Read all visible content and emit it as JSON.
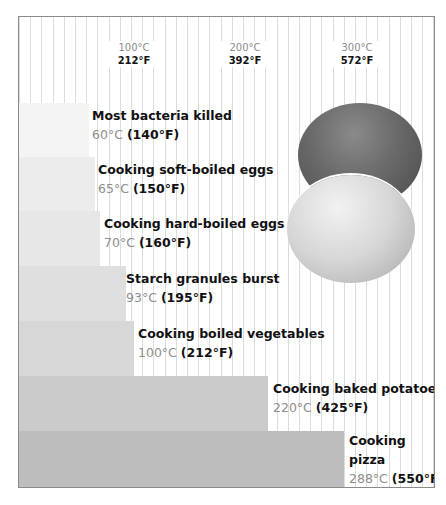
{
  "chart_data": {
    "type": "bar",
    "orientation": "horizontal",
    "title": "",
    "xlabel": "Temperature",
    "ylabel": "",
    "x_scale": {
      "min_c": 0,
      "px_per_c": 1.117,
      "origin_px": 3
    },
    "xlim_c": [
      0,
      370
    ],
    "grid": {
      "vertical": true,
      "spacing_px": 11.2
    },
    "ticks": [
      {
        "c": "100°C",
        "f": "212°F",
        "value": 100
      },
      {
        "c": "200°C",
        "f": "392°F",
        "value": 200
      },
      {
        "c": "300°C",
        "f": "572°F",
        "value": 300
      }
    ],
    "categories": [
      "Most bacteria killed",
      "Cooking soft-boiled eggs",
      "Cooking hard-boiled eggs",
      "Starch granules burst",
      "Cooking boiled vegetables",
      "Cooking baked potatoes",
      "Cooking pizza"
    ],
    "values_c": [
      60,
      65,
      70,
      93,
      100,
      220,
      288
    ],
    "values_f": [
      140,
      150,
      160,
      195,
      212,
      425,
      550
    ],
    "bars": [
      {
        "title": "Most bacteria killed",
        "c_label": "60°C",
        "f_label": "(140°F)",
        "value": 60,
        "top": 86,
        "height": 54,
        "color": "#f4f4f4",
        "label_left": 73,
        "label_top": 0
      },
      {
        "title": "Cooking soft-boiled eggs",
        "c_label": "65°C",
        "f_label": "(150°F)",
        "value": 65,
        "top": 140,
        "height": 54,
        "color": "#ececec",
        "label_left": 79,
        "label_top": 0
      },
      {
        "title": "Cooking hard-boiled eggs",
        "c_label": "70°C",
        "f_label": "(160°F)",
        "value": 70,
        "top": 194,
        "height": 55,
        "color": "#e7e7e7",
        "label_left": 85,
        "label_top": 0
      },
      {
        "title": "Starch granules burst",
        "c_label": "93°C",
        "f_label": "(195°F)",
        "value": 93,
        "top": 249,
        "height": 55,
        "color": "#dfdfdf",
        "label_left": 107,
        "label_top": 0
      },
      {
        "title": "Cooking boiled vegetables",
        "c_label": "100°C",
        "f_label": "(212°F)",
        "value": 100,
        "top": 304,
        "height": 55,
        "color": "#d7d7d7",
        "label_left": 119,
        "label_top": 0
      },
      {
        "title": "Cooking baked potatoes",
        "c_label": "220°C",
        "f_label": "(425°F)",
        "value": 220,
        "top": 359,
        "height": 55,
        "color": "#cbcbcb",
        "label_left": 254,
        "label_top": 0
      },
      {
        "title": "Cooking\npizza",
        "c_label": "288°C",
        "f_label": "(550°F)",
        "value": 288,
        "top": 414,
        "height": 58,
        "color": "#bdbdbd",
        "label_left": 330,
        "label_top": -3
      }
    ],
    "legend": null,
    "annotations": [
      "illustration: brown egg and white egg"
    ]
  },
  "illustration": {
    "items": [
      "brown-egg",
      "white-egg"
    ]
  }
}
